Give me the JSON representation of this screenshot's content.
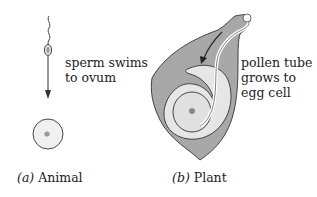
{
  "panel_a": {
    "annotation_line1": "sperm swims",
    "annotation_line2": "to ovum",
    "caption_prefix": "(a)",
    "caption": "Animal"
  },
  "panel_b": {
    "annotation_line1": "pollen tube",
    "annotation_line2": "grows to",
    "annotation_line3": "egg cell",
    "caption_prefix": "(b)",
    "caption": "Plant"
  },
  "colors": {
    "tissue": "#a8a8a8",
    "light": "#e6e6e6",
    "outline": "#333333"
  }
}
